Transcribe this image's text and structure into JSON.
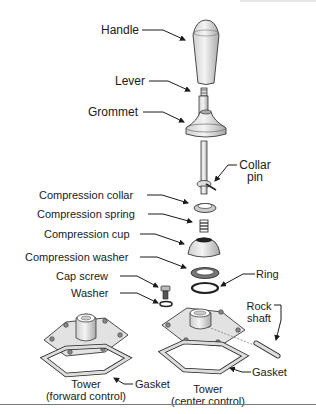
{
  "diagram": {
    "type": "exploded-parts-view",
    "labels": {
      "handle": "Handle",
      "lever": "Lever",
      "grommet": "Grommet",
      "collar_pin_1": "Collar",
      "collar_pin_2": "pin",
      "compression_collar": "Compression collar",
      "compression_spring": "Compression spring",
      "compression_cup": "Compression cup",
      "compression_washer": "Compression washer",
      "ring": "Ring",
      "cap_screw": "Cap screw",
      "washer": "Washer",
      "rock_shaft_1": "Rock",
      "rock_shaft_2": "shaft",
      "gasket_forward": "Gasket",
      "gasket_center": "Gasket",
      "tower_forward_1": "Tower",
      "tower_forward_2": "(forward control)",
      "tower_center_1": "Tower",
      "tower_center_2": "(center control)"
    },
    "colors": {
      "part_fill": "#e4e4e4",
      "part_shade": "#bdbdbd",
      "outline": "#222222",
      "dark": "#333333"
    }
  }
}
